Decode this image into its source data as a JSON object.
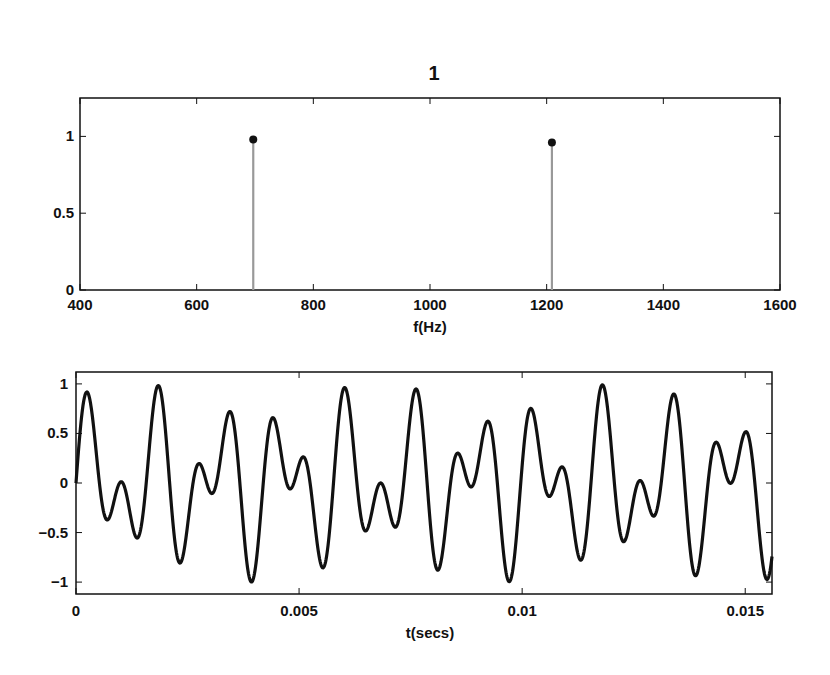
{
  "chart_data": [
    {
      "type": "stem",
      "title": "1",
      "xlabel": "f(Hz)",
      "ylabel": "",
      "xlim": [
        400,
        1600
      ],
      "ylim": [
        0,
        1.25
      ],
      "xticks": [
        400,
        600,
        800,
        1000,
        1200,
        1400,
        1600
      ],
      "xtick_labels": [
        "400",
        "600",
        "800",
        "1000",
        "1200",
        "1400",
        "1600"
      ],
      "yticks": [
        0,
        0.5,
        1
      ],
      "ytick_labels": [
        "0",
        "0.5",
        "1"
      ],
      "x": [
        697,
        1209
      ],
      "values": [
        0.98,
        0.96
      ],
      "grid": false,
      "stem_color": "#999999",
      "marker_color": "#111111"
    },
    {
      "type": "line",
      "title": "",
      "xlabel": "t(secs)",
      "ylabel": "",
      "xlim": [
        0,
        0.0156
      ],
      "ylim": [
        -1.12,
        1.12
      ],
      "xticks": [
        0,
        0.005,
        0.01,
        0.015
      ],
      "xtick_labels": [
        "0",
        "0.005",
        "0.01",
        "0.015"
      ],
      "yticks": [
        -1,
        -0.5,
        0,
        0.5,
        1
      ],
      "ytick_labels": [
        "−1",
        "−0.5",
        "0",
        "0.5",
        "1"
      ],
      "series": [
        {
          "name": "0.5*sin(2*pi*697*t) + 0.5*sin(2*pi*1209*t)",
          "components": [
            {
              "freq_hz": 697,
              "amplitude": 0.5
            },
            {
              "freq_hz": 1209,
              "amplitude": 0.5
            }
          ],
          "color": "#111111"
        }
      ],
      "grid": false
    }
  ]
}
